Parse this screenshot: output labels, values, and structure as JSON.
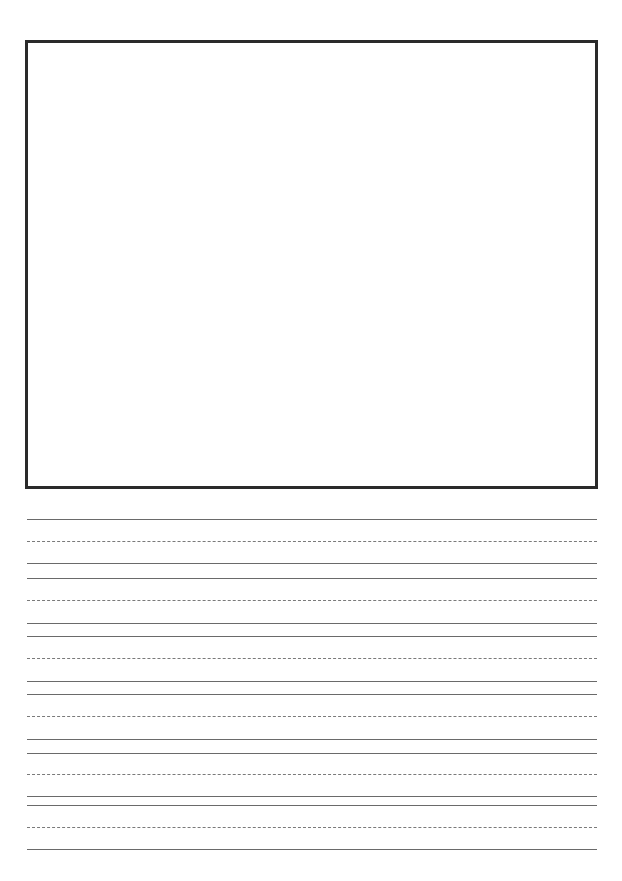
{
  "page": {
    "colors": {
      "border": "#2a2a2a",
      "line": "#6a6a6a",
      "dashed_line": "#7a7a7a",
      "background": "#ffffff"
    }
  },
  "drawing_box": {
    "label": ""
  },
  "writing_lines": [
    {
      "y": 519,
      "style": "solid"
    },
    {
      "y": 541,
      "style": "dashed"
    },
    {
      "y": 563,
      "style": "solid"
    },
    {
      "y": 578,
      "style": "solid"
    },
    {
      "y": 600,
      "style": "dashed"
    },
    {
      "y": 623,
      "style": "solid"
    },
    {
      "y": 636,
      "style": "solid"
    },
    {
      "y": 658,
      "style": "dashed"
    },
    {
      "y": 681,
      "style": "solid"
    },
    {
      "y": 694,
      "style": "solid"
    },
    {
      "y": 716,
      "style": "dashed"
    },
    {
      "y": 739,
      "style": "solid"
    },
    {
      "y": 753,
      "style": "solid"
    },
    {
      "y": 774,
      "style": "dashed"
    },
    {
      "y": 796,
      "style": "solid"
    },
    {
      "y": 805,
      "style": "solid"
    },
    {
      "y": 827,
      "style": "dashed"
    },
    {
      "y": 849,
      "style": "solid"
    }
  ]
}
